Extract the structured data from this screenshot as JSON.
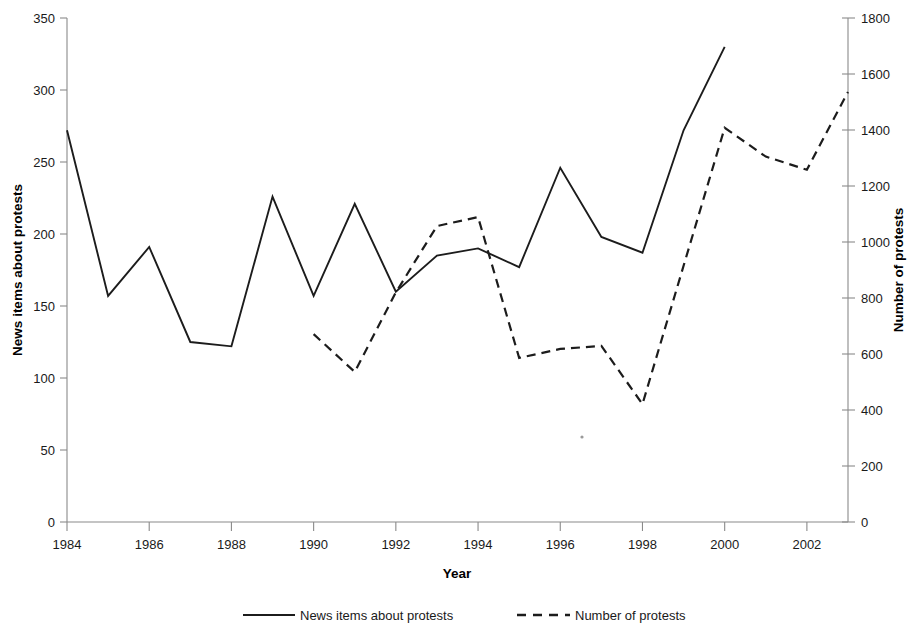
{
  "chart_data": {
    "type": "line",
    "title": "",
    "xlabel": "Year",
    "ylabel": "News items about protests",
    "y2label": "Number of protests",
    "grid": false,
    "legend_position": "bottom",
    "x": [
      1984,
      1985,
      1986,
      1987,
      1988,
      1989,
      1990,
      1991,
      1992,
      1993,
      1994,
      1995,
      1996,
      1997,
      1998,
      1999,
      2000,
      2001,
      2002,
      2003
    ],
    "xlim": [
      1984,
      2003
    ],
    "xticks": [
      1984,
      1986,
      1988,
      1990,
      1992,
      1994,
      1996,
      1998,
      2000,
      2002
    ],
    "xtick_labels": [
      "1984",
      "1986",
      "1988",
      "1990",
      "1992",
      "1994",
      "1996",
      "1998",
      "2000",
      "2002"
    ],
    "ylim": [
      0,
      350
    ],
    "yticks": [
      0,
      50,
      100,
      150,
      200,
      250,
      300,
      350
    ],
    "ytick_labels": [
      "0",
      "50",
      "100",
      "150",
      "200",
      "250",
      "300",
      "350"
    ],
    "y2lim": [
      0,
      1800
    ],
    "y2ticks": [
      0,
      200,
      400,
      600,
      800,
      1000,
      1200,
      1400,
      1600,
      1800
    ],
    "y2tick_labels": [
      "0",
      "200",
      "400",
      "600",
      "800",
      "1000",
      "1200",
      "1400",
      "1600",
      "1800"
    ],
    "series": [
      {
        "name": "News items about protests",
        "axis": "left",
        "style": "solid",
        "color": "#1c1c1c",
        "x": [
          1984,
          1985,
          1986,
          1987,
          1988,
          1989,
          1990,
          1991,
          1992,
          1993,
          1994,
          1995,
          1996,
          1997,
          1998,
          1999,
          2000
        ],
        "values": [
          272,
          157,
          191,
          125,
          122,
          226,
          157,
          221,
          160,
          185,
          190,
          177,
          246,
          198,
          187,
          272,
          330
        ]
      },
      {
        "name": "Number of protests",
        "axis": "right",
        "style": "dashed",
        "color": "#1c1c1c",
        "x": [
          1990,
          1991,
          1992,
          1993,
          1994,
          1995,
          1996,
          1997,
          1998,
          1999,
          2000,
          2001,
          2002,
          2003
        ],
        "values": [
          671,
          536,
          820,
          1057,
          1089,
          586,
          618,
          629,
          421,
          915,
          1408,
          1305,
          1258,
          1536
        ]
      }
    ]
  },
  "legend": {
    "items": [
      {
        "label": "News items about protests",
        "style": "solid"
      },
      {
        "label": "Number of protests",
        "style": "dashed"
      }
    ]
  }
}
